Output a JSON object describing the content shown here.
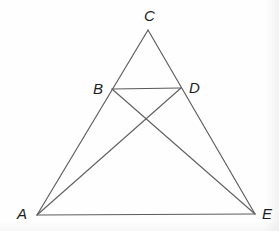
{
  "figure": {
    "title": "Triangle ACE with midsegment BD and cevians AD and BE",
    "canvas": {
      "width": 279,
      "height": 231
    },
    "background_color": "#fefefe",
    "stroke_color": "#5c5c5c",
    "label_color": "#1d1d1d",
    "points": {
      "A": {
        "name": "A",
        "x": 37,
        "y": 215
      },
      "B": {
        "name": "B",
        "x": 112,
        "y": 89
      },
      "C": {
        "name": "C",
        "x": 148,
        "y": 30
      },
      "D": {
        "name": "D",
        "x": 181,
        "y": 88
      },
      "E": {
        "name": "E",
        "x": 255,
        "y": 214
      }
    },
    "labels": [
      {
        "text": "C",
        "x": 144,
        "y": 8
      },
      {
        "text": "B",
        "x": 93,
        "y": 81
      },
      {
        "text": "D",
        "x": 189,
        "y": 80
      },
      {
        "text": "A",
        "x": 17,
        "y": 206
      },
      {
        "text": "E",
        "x": 262,
        "y": 206
      }
    ],
    "segments": [
      {
        "name": "side-AC",
        "from": "A",
        "to": "C",
        "kind": "edge"
      },
      {
        "name": "side-CE",
        "from": "C",
        "to": "E",
        "kind": "edge"
      },
      {
        "name": "side-AE",
        "from": "A",
        "to": "E",
        "kind": "edge"
      },
      {
        "name": "segment-BD",
        "from": "B",
        "to": "D",
        "kind": "midsegment"
      },
      {
        "name": "cevian-BE",
        "from": "B",
        "to": "E",
        "kind": "cevian"
      },
      {
        "name": "cevian-AD",
        "from": "A",
        "to": "D",
        "kind": "cevian"
      }
    ],
    "intersection": {
      "name": "BE-AD-crossing",
      "x": 147,
      "y": 117
    }
  }
}
